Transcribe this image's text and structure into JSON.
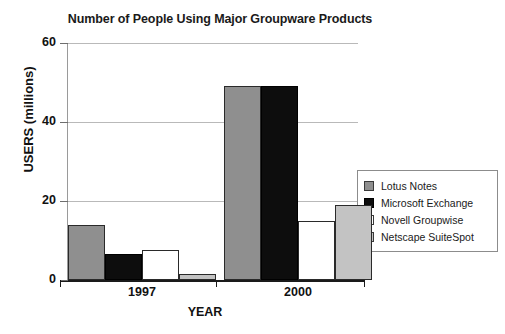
{
  "chart_data": {
    "type": "bar",
    "title": "Number of People Using Major Groupware Products",
    "xlabel": "YEAR",
    "ylabel": "USERS  (millions)",
    "categories": [
      "1997",
      "2000"
    ],
    "series": [
      {
        "name": "Lotus Notes",
        "color": "#8f8f8f",
        "values": [
          14,
          49
        ]
      },
      {
        "name": "Microsoft Exchange",
        "color": "#0d0d0d",
        "values": [
          6.5,
          49
        ]
      },
      {
        "name": "Novell Groupwise",
        "color": "#ffffff",
        "values": [
          7.5,
          15
        ]
      },
      {
        "name": "Netscape SuiteSpot",
        "color": "#c3c3c3",
        "values": [
          1.5,
          19
        ]
      }
    ],
    "ylim": [
      0,
      60
    ],
    "yticks": [
      0,
      20,
      40,
      60
    ],
    "ytick_labels": [
      "0",
      "20",
      "40",
      "60"
    ],
    "grid": true,
    "legend_position": "right"
  },
  "legend": {
    "entries": [
      {
        "label": "Lotus Notes"
      },
      {
        "label": "Microsoft Exchange"
      },
      {
        "label": "Novell Groupwise"
      },
      {
        "label": "Netscape SuiteSpot"
      }
    ]
  },
  "caption_fragment": ""
}
